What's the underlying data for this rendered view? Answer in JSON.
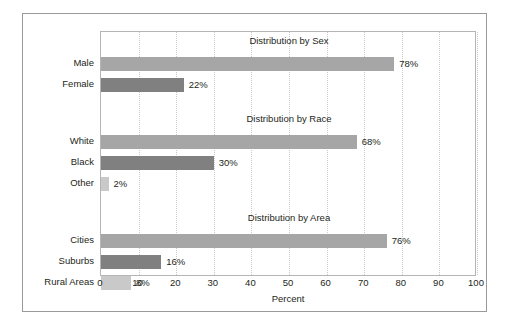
{
  "chart_data": {
    "type": "bar",
    "orientation": "horizontal",
    "title": "",
    "xlabel": "Percent",
    "ylabel": "",
    "xlim": [
      0,
      100
    ],
    "xticks": [
      "0",
      "10",
      "20",
      "30",
      "40",
      "50",
      "60",
      "70",
      "80",
      "90",
      "100"
    ],
    "grid": "vertical-dotted",
    "legend": "none",
    "value_suffix": "%",
    "colors": {
      "bar_medium": "#a6a6a6",
      "bar_dark": "#808080",
      "bar_light": "#c9c9c9",
      "plot_border": "#b5b5b5",
      "frame_border": "#9a9a9a",
      "gridline": "#c9c9c9",
      "text": "#231f20"
    },
    "sections": [
      {
        "title": "Distribution by Sex",
        "categories": [
          "Male",
          "Female"
        ],
        "values": [
          78,
          22
        ],
        "labels": [
          "78%",
          "22%"
        ],
        "shades": [
          "bar_medium",
          "bar_dark"
        ]
      },
      {
        "title": "Distribution by Race",
        "categories": [
          "White",
          "Black",
          "Other"
        ],
        "values": [
          68,
          30,
          2
        ],
        "labels": [
          "68%",
          "30%",
          "2%"
        ],
        "shades": [
          "bar_medium",
          "bar_dark",
          "bar_light"
        ]
      },
      {
        "title": "Distribution by Area",
        "categories": [
          "Cities",
          "Suburbs",
          "Rural Areas"
        ],
        "values": [
          76,
          16,
          8
        ],
        "labels": [
          "76%",
          "16%",
          "8%"
        ],
        "shades": [
          "bar_medium",
          "bar_dark",
          "bar_light"
        ]
      }
    ]
  }
}
